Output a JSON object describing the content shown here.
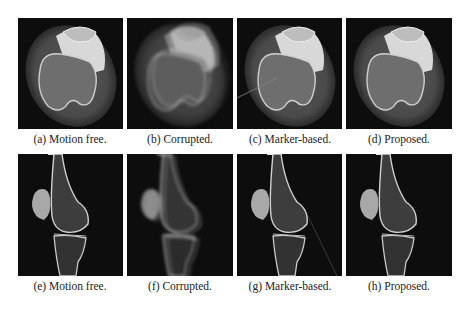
{
  "figure": {
    "rows": [
      {
        "view": "axial",
        "panels": [
          {
            "label": "(a) Motion free.",
            "variant": "motion-free"
          },
          {
            "label": "(b) Corrupted.",
            "variant": "corrupted"
          },
          {
            "label": "(c) Marker-based.",
            "variant": "marker-based"
          },
          {
            "label": "(d) Proposed.",
            "variant": "proposed"
          }
        ]
      },
      {
        "view": "sagittal",
        "panels": [
          {
            "label": "(e) Motion free.",
            "variant": "motion-free"
          },
          {
            "label": "(f) Corrupted.",
            "variant": "corrupted"
          },
          {
            "label": "(g) Marker-based.",
            "variant": "marker-based"
          },
          {
            "label": "(h) Proposed.",
            "variant": "proposed"
          }
        ]
      }
    ]
  }
}
